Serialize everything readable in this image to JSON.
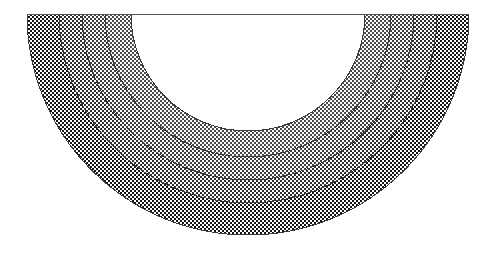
{
  "figure": {
    "name": "concentric-semicircular-zones",
    "background_color": "#ffffff",
    "outline_color": "#3a3a3a",
    "outline_width": 1,
    "canvas": {
      "width": 496,
      "height": 256
    },
    "geometry": {
      "center_x": 248,
      "center_y": 14,
      "orientation": "lower-half",
      "start_angle_deg": 0,
      "sweep_angle_deg": 180,
      "outer_radius": 221,
      "inner_core_radius": 117,
      "baseline_y": 14,
      "baseline_x_start": 27,
      "baseline_x_end": 469
    },
    "diameter_line": {
      "name": "diameter-baseline",
      "color": "#555555",
      "width": 1
    },
    "zones": [
      {
        "id": "zone-core",
        "label": "core",
        "inner_radius": 0,
        "outer_radius": 117,
        "fill": "#ffffff",
        "pattern": "none",
        "dot_color": "#ffffff",
        "dot_size": 0,
        "dot_spacing": 4,
        "tone_percent": 0
      },
      {
        "id": "zone-1",
        "label": "zone 1 (lightest)",
        "inner_radius": 117,
        "outer_radius": 143,
        "fill": "#f2f2f2",
        "pattern": "dot-halftone",
        "dot_color": "#4a4a4a",
        "dot_size": 0.85,
        "dot_spacing": 4,
        "tone_percent": 12
      },
      {
        "id": "zone-2",
        "label": "zone 2 (light)",
        "inner_radius": 143,
        "outer_radius": 166,
        "fill": "#e6e6e6",
        "pattern": "dot-halftone",
        "dot_color": "#3d3d3d",
        "dot_size": 1.15,
        "dot_spacing": 4,
        "tone_percent": 28
      },
      {
        "id": "zone-3",
        "label": "zone 3 (medium)",
        "inner_radius": 166,
        "outer_radius": 189,
        "fill": "#d4d4d4",
        "pattern": "dot-halftone",
        "dot_color": "#2f2f2f",
        "dot_size": 1.45,
        "dot_spacing": 4,
        "tone_percent": 45
      },
      {
        "id": "zone-4",
        "label": "zone 4 (darkest)",
        "inner_radius": 189,
        "outer_radius": 221,
        "fill": "#8f8f8f",
        "pattern": "checker-halftone",
        "dot_color": "#1a1a1a",
        "dot_size": 2.0,
        "dot_spacing": 4,
        "tone_percent": 72
      }
    ]
  }
}
